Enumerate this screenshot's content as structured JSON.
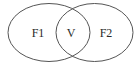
{
  "diagram": {
    "type": "venn",
    "sets": [
      {
        "id": "left",
        "label": "F1",
        "cx": 49,
        "cy": 32.5,
        "rx": 41,
        "ry": 29
      },
      {
        "id": "right",
        "label": "F2",
        "cx": 94.5,
        "cy": 32.5,
        "rx": 38.5,
        "ry": 29
      }
    ],
    "intersection": {
      "label": "V"
    },
    "colors": {
      "stroke": "#555555",
      "text": "#2a2a2a",
      "background": "#ffffff"
    }
  }
}
